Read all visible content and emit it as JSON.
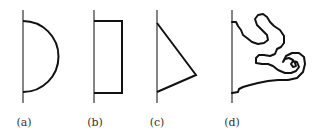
{
  "figure": {
    "panels": [
      {
        "id": "a",
        "label": "(a)",
        "shape": "semicircle",
        "wall_x": 23,
        "label_x": 24
      },
      {
        "id": "b",
        "label": "(b)",
        "shape": "rectangle",
        "wall_x": 94,
        "label_x": 95
      },
      {
        "id": "c",
        "label": "(c)",
        "shape": "triangle",
        "wall_x": 157,
        "label_x": 157
      },
      {
        "id": "d",
        "label": "(d)",
        "shape": "irregular-blob",
        "wall_x": 232,
        "label_x": 232
      }
    ],
    "colors": {
      "stroke": "#111111",
      "wall": "#333333",
      "label": "#333333",
      "background": "#ffffff"
    }
  }
}
